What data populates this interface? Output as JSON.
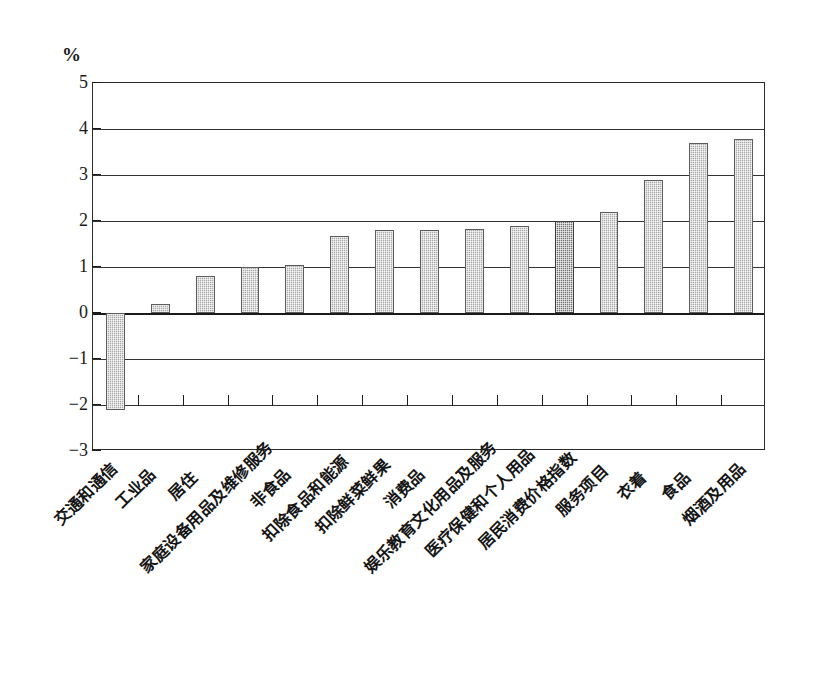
{
  "axis": {
    "y_unit": "%",
    "y_ticks": [
      5,
      4,
      3,
      2,
      1,
      0,
      -1,
      -2,
      -3
    ],
    "y_tick_labels": [
      "5",
      "4",
      "3",
      "2",
      "1",
      "0",
      "−1",
      "−2",
      "−3"
    ]
  },
  "colors": {
    "bar_fill": "#a8a8a8",
    "bar_highlight": "#6f6f6f",
    "bar_border": "#5c5c5c",
    "axis": "#1a1a1a",
    "grid": "#333333",
    "background": "#ffffff"
  },
  "chart_data": {
    "type": "bar",
    "title": "",
    "subtitle": "",
    "xlabel": "",
    "ylabel": "%",
    "ylim": [
      -3,
      5
    ],
    "grid": true,
    "legend": "none",
    "orientation": "vertical",
    "categories": [
      "交通和通信",
      "工业品",
      "居住",
      "家庭设备用品及维修服务",
      "非食品",
      "扣除食品和能源",
      "扣除鲜菜鲜果",
      "消费品",
      "娱乐教育文化用品及服务",
      "医疗保健和个人用品",
      "居民消费价格指数",
      "服务项目",
      "衣着",
      "食品",
      "烟酒及用品"
    ],
    "values": [
      -2.1,
      0.2,
      0.8,
      1.0,
      1.05,
      1.67,
      1.8,
      1.8,
      1.82,
      1.9,
      2.0,
      2.2,
      2.9,
      3.7,
      3.78
    ],
    "highlight_index": 10,
    "highlight_category": "居民消费价格指数"
  }
}
